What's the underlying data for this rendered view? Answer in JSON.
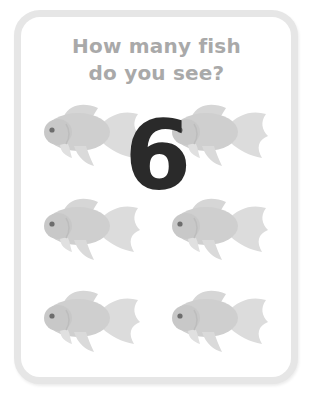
{
  "question": {
    "line1": "How many fish",
    "line2": "do you see?"
  },
  "answer": "6",
  "fish": {
    "count": 6,
    "icon": "goldfish-icon",
    "color": "#d4d4d4",
    "positions": [
      {
        "row": 1,
        "col": 1
      },
      {
        "row": 1,
        "col": 2
      },
      {
        "row": 2,
        "col": 1
      },
      {
        "row": 2,
        "col": 2
      },
      {
        "row": 3,
        "col": 1
      },
      {
        "row": 3,
        "col": 2
      }
    ]
  },
  "colors": {
    "border": "#e6e6e6",
    "question_text": "#a9a9a9",
    "number": "#2a2a2a"
  }
}
